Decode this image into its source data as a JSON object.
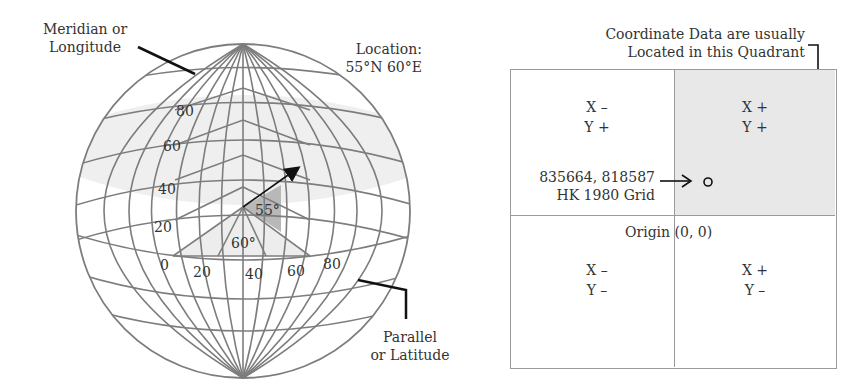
{
  "globe": {
    "labels": {
      "meridian_line1": "Meridian or",
      "meridian_line2": "Longitude",
      "location_line1": "Location:",
      "location_line2": "55°N 60°E",
      "parallel_line1": "Parallel",
      "parallel_line2": "or Latitude"
    },
    "latitude_ticks": [
      "80",
      "60",
      "40",
      "20",
      "0"
    ],
    "longitude_ticks": [
      "20",
      "40",
      "60",
      "80"
    ],
    "angles": {
      "lat_angle": "55°",
      "lon_angle": "60°"
    },
    "colors": {
      "grid": "#7a7a7a",
      "highlight_band": "#ececec",
      "lat_wedge": "#b5b5b5",
      "lon_wedge": "#ececec"
    }
  },
  "quadrants": {
    "caption_line1": "Coordinate Data are usually",
    "caption_line2": "Located in this Quadrant",
    "top_left": {
      "x": "X –",
      "y": "Y +"
    },
    "top_right": {
      "x": "X +",
      "y": "Y +"
    },
    "bottom_left": {
      "x": "X –",
      "y": "Y –"
    },
    "bottom_right": {
      "x": "X +",
      "y": "Y –"
    },
    "point_coords": "835664, 818587",
    "point_grid": "HK 1980 Grid",
    "origin_label": "Origin",
    "origin_coords": "(0, 0)",
    "colors": {
      "highlight": "#e8e8e8",
      "border": "#9a9a9a"
    }
  }
}
